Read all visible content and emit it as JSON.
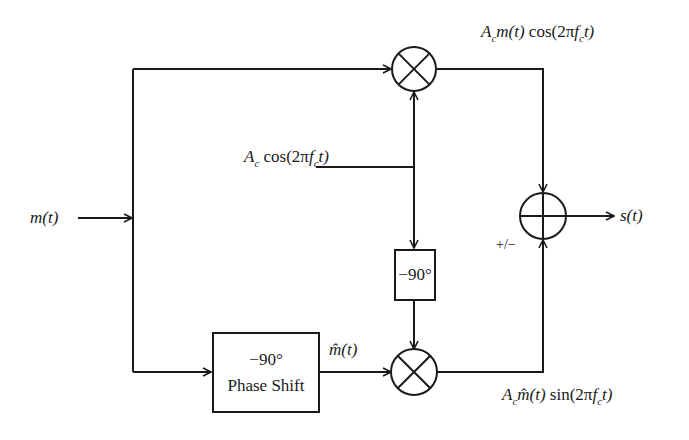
{
  "diagram": {
    "type": "block-diagram",
    "input": {
      "label": "m(t)"
    },
    "output": {
      "label": "s(t)"
    },
    "carrier": {
      "amp": "A",
      "amp_sub": "c",
      "expr_pre": "cos(2π",
      "f": "f",
      "f_sub": "c",
      "expr_post": "t)"
    },
    "top_product": {
      "amp": "A",
      "amp_sub": "c",
      "sig": "m(t)",
      "fn": "cos(2π",
      "f": "f",
      "f_sub": "c",
      "tail": "t)"
    },
    "bottom_product": {
      "amp": "A",
      "amp_sub": "c",
      "sig": "m̂(t)",
      "fn": "sin(2π",
      "f": "f",
      "f_sub": "c",
      "tail": "t)"
    },
    "hilbert_output": {
      "label": "m̂(t)"
    },
    "blocks": {
      "phase_shift": {
        "line1": "−90°",
        "line2": "Phase Shift"
      },
      "carrier_shift": {
        "label": "−90°"
      }
    },
    "summer": {
      "sign_label": "+/−"
    }
  }
}
